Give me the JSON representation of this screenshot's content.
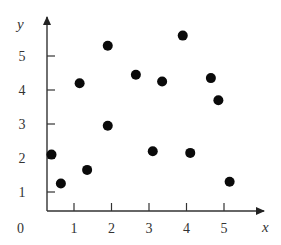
{
  "chart_data": {
    "type": "scatter",
    "title": "",
    "xlabel": "x",
    "ylabel": "y",
    "xlim": [
      0,
      5.8
    ],
    "ylim": [
      0,
      5.8
    ],
    "grid": false,
    "legend": null,
    "origin_label": "0",
    "x_ticks": [
      "1",
      "2",
      "3",
      "4",
      "5"
    ],
    "y_ticks": [
      "1",
      "2",
      "3",
      "4",
      "5"
    ],
    "x": [
      0.4,
      0.65,
      1.35,
      1.15,
      1.9,
      1.9,
      2.65,
      3.35,
      3.1,
      3.9,
      4.1,
      4.65,
      4.85,
      5.15
    ],
    "y": [
      2.1,
      1.25,
      1.65,
      4.2,
      5.3,
      2.95,
      4.45,
      4.25,
      2.2,
      5.6,
      2.15,
      4.35,
      3.7,
      1.3
    ],
    "marker": "filled-circle",
    "marker_color": "#0a0a0a"
  }
}
